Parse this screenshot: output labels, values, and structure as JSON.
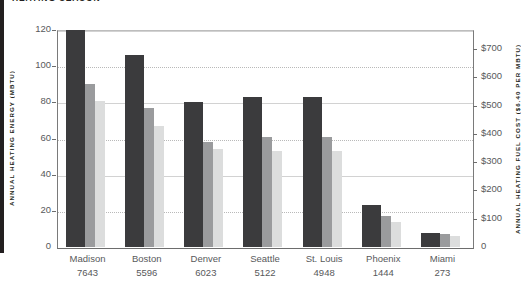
{
  "title": "HEATING SEASON",
  "axes": {
    "left_title": "ANNUAL HEATING ENERGY (MBTU)",
    "right_title": "ANNUAL HEATING FUEL COST ($6.40 PER MBTU)",
    "left_ticks": [
      "0",
      "20",
      "40",
      "60",
      "80",
      "100",
      "120"
    ],
    "right_ticks": [
      "0",
      "$100",
      "$200",
      "$300",
      "$400",
      "$500",
      "$600",
      "$700"
    ]
  },
  "chart_data": {
    "type": "bar",
    "title": "HEATING SEASON",
    "xlabel": "",
    "ylabel": "ANNUAL HEATING ENERGY (MBTU)",
    "y2label": "ANNUAL HEATING FUEL COST ($6.40 PER MBTU)",
    "ylim": [
      0,
      120
    ],
    "y2lim": [
      0,
      768
    ],
    "yticks": [
      0,
      20,
      40,
      60,
      80,
      100,
      120
    ],
    "y2ticks": [
      0,
      100,
      200,
      300,
      400,
      500,
      600,
      700
    ],
    "grid": true,
    "legend": "none",
    "categories": [
      "Madison",
      "Boston",
      "Denver",
      "Seattle",
      "St. Louis",
      "Phoenix",
      "Miami"
    ],
    "category_sublabels": [
      "7643",
      "5596",
      "6023",
      "5122",
      "4948",
      "1444",
      "273"
    ],
    "sublabel_meaning": "heating degree days",
    "series": [
      {
        "name": "series-1-dark",
        "color": "#3b3b3d",
        "values": [
          120,
          106,
          80,
          83,
          83,
          23,
          8
        ]
      },
      {
        "name": "series-2-medium",
        "color": "#9a9b9d",
        "values": [
          90,
          77,
          58,
          61,
          61,
          17,
          7
        ]
      },
      {
        "name": "series-3-light",
        "color": "#dcdddd",
        "values": [
          81,
          67,
          54,
          53,
          53,
          14,
          6
        ]
      }
    ]
  },
  "x_labels": [
    {
      "city": "Madison",
      "hdd": "7643"
    },
    {
      "city": "Boston",
      "hdd": "5596"
    },
    {
      "city": "Denver",
      "hdd": "6023"
    },
    {
      "city": "Seattle",
      "hdd": "5122"
    },
    {
      "city": "St. Louis",
      "hdd": "4948"
    },
    {
      "city": "Phoenix",
      "hdd": "1444"
    },
    {
      "city": "Miami",
      "hdd": "273"
    }
  ]
}
